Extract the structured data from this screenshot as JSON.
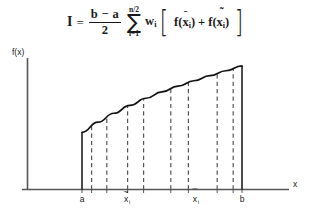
{
  "formula": {
    "lhs": "I",
    "equals": "=",
    "fraction": {
      "numerator": "b − a",
      "denominator": "2"
    },
    "sum": {
      "symbol": "∑",
      "upper_limit": "n/2",
      "lower_limit": "i=1"
    },
    "weight": "w",
    "weight_subscript": "i",
    "bracket_open": "[",
    "bracket_close": "]",
    "term1": {
      "func": "f",
      "paren_open": "(",
      "var": "x",
      "accent": "̄",
      "subscript": "i",
      "paren_close": ")"
    },
    "operator": "+",
    "term2": {
      "func": "f",
      "paren_open": "(",
      "var": "x",
      "accent": "̃",
      "subscript": "i",
      "paren_close": ")"
    },
    "plain_text": "I = (b − a)/2 ∑(i=1 to n/2) wᵢ [ f(x̄ᵢ) + f(x̃ᵢ) ]"
  },
  "chart_data": {
    "type": "area",
    "title": "",
    "xlabel": "x",
    "ylabel": "f(x)",
    "grid": false,
    "legend": false,
    "axis_labels": {
      "y": "f(x)",
      "x": "x"
    },
    "x_tick_labels": [
      {
        "label": "a",
        "accent": "",
        "subscript": "",
        "x": 0.0
      },
      {
        "label": "x",
        "accent": "̃",
        "subscript": "i",
        "x": 0.285
      },
      {
        "label": "x",
        "accent": "̄",
        "subscript": "i",
        "x": 0.715
      },
      {
        "label": "b",
        "accent": "",
        "subscript": "",
        "x": 1.0
      }
    ],
    "x_domain": [
      0,
      1
    ],
    "curve_description": "monotonically increasing concave-down curve f(x) from a to b",
    "curve_points": [
      {
        "x": 0.0,
        "y": 0.435
      },
      {
        "x": 0.1,
        "y": 0.512
      },
      {
        "x": 0.2,
        "y": 0.58
      },
      {
        "x": 0.3,
        "y": 0.64
      },
      {
        "x": 0.4,
        "y": 0.694
      },
      {
        "x": 0.5,
        "y": 0.742
      },
      {
        "x": 0.6,
        "y": 0.786
      },
      {
        "x": 0.7,
        "y": 0.827
      },
      {
        "x": 0.8,
        "y": 0.866
      },
      {
        "x": 0.9,
        "y": 0.903
      },
      {
        "x": 1.0,
        "y": 0.94
      }
    ],
    "solid_boundaries": [
      {
        "name": "left-boundary-a",
        "x": 0.0
      },
      {
        "name": "right-boundary-b",
        "x": 1.0
      }
    ],
    "dashed_lines": [
      {
        "name": "quadrature-line-1",
        "x": 0.06
      },
      {
        "name": "quadrature-line-2",
        "x": 0.155
      },
      {
        "name": "quadrature-line-3",
        "x": 0.285
      },
      {
        "name": "quadrature-line-4",
        "x": 0.385
      },
      {
        "name": "quadrature-line-5",
        "x": 0.555
      },
      {
        "name": "quadrature-line-6",
        "x": 0.665
      },
      {
        "name": "quadrature-line-7",
        "x": 0.845
      },
      {
        "name": "quadrature-line-8",
        "x": 0.945
      }
    ],
    "tick_marks_x": [
      0.0,
      0.06,
      0.155,
      0.285,
      0.385,
      0.555,
      0.665,
      0.845,
      0.945,
      1.0
    ]
  },
  "colors": {
    "ink": "#1a1a1a",
    "axis": "#555555",
    "curve": "#111111",
    "dashed": "#555555",
    "background": "#ffffff"
  }
}
